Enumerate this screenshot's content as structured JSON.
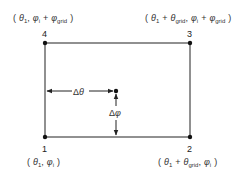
{
  "diagram": {
    "type": "grid-cell-interpolation",
    "colors": {
      "stroke": "#222222",
      "text": "#333333",
      "background": "#ffffff"
    },
    "corners": [
      {
        "id": "1",
        "number": "1",
        "label_parts": [
          "( ",
          "θ",
          "1",
          ", ",
          "φ",
          "i",
          " )"
        ],
        "position": "bottom-left"
      },
      {
        "id": "2",
        "number": "2",
        "label_parts": [
          "( ",
          "θ",
          "1",
          " + ",
          "θ",
          "grid",
          ", ",
          "φ",
          "i",
          " )"
        ],
        "position": "bottom-right"
      },
      {
        "id": "3",
        "number": "3",
        "label_parts": [
          "( ",
          "θ",
          "1",
          " + ",
          "θ",
          "grid",
          ", ",
          "φ",
          "i",
          " + ",
          "φ",
          "grid",
          " )"
        ],
        "position": "top-right"
      },
      {
        "id": "4",
        "number": "4",
        "label_parts": [
          "( ",
          "θ",
          "1",
          ", ",
          "φ",
          "i",
          " + ",
          "φ",
          "grid",
          " )"
        ],
        "position": "top-left"
      }
    ],
    "offsets": {
      "theta": {
        "symbol": "Δθ"
      },
      "phi": {
        "symbol": "Δφ"
      }
    },
    "labels": {
      "c1_num": "1",
      "c2_num": "2",
      "c3_num": "3",
      "c4_num": "4",
      "theta": "θ",
      "phi": "φ",
      "sub_1": "1",
      "sub_i": "i",
      "sub_grid": "grid",
      "open": "(",
      "close": ")",
      "comma": ",",
      "plus": "+",
      "delta": "Δ"
    }
  }
}
